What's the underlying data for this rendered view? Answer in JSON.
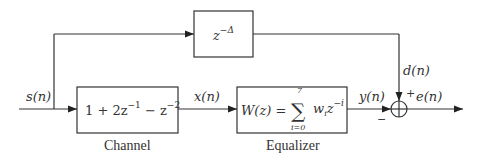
{
  "diagram": {
    "signals": {
      "input": "s(n)",
      "channel_output": "x(n)",
      "equalizer_output": "y(n)",
      "desired": "d(n)",
      "error": "e(n)"
    },
    "blocks": {
      "delay": {
        "expr_base": "z",
        "expr_exp": "−Δ"
      },
      "channel": {
        "expr_parts": [
          "1 + 2z",
          "−1",
          " − z",
          "−2"
        ],
        "caption": "Channel"
      },
      "equalizer": {
        "lhs": "W(z) = ",
        "sum_upper": "7",
        "sum_lower": "i=0",
        "sum_symbol": "∑",
        "term_base": "w",
        "term_sub": "i",
        "term_z": "z",
        "term_exp": "−i",
        "caption": "Equalizer"
      }
    },
    "summer": {
      "plus_sign": "+",
      "minus_sign": "−"
    },
    "colors": {
      "stroke": "#333333",
      "text": "#333333",
      "background": "#ffffff"
    }
  }
}
